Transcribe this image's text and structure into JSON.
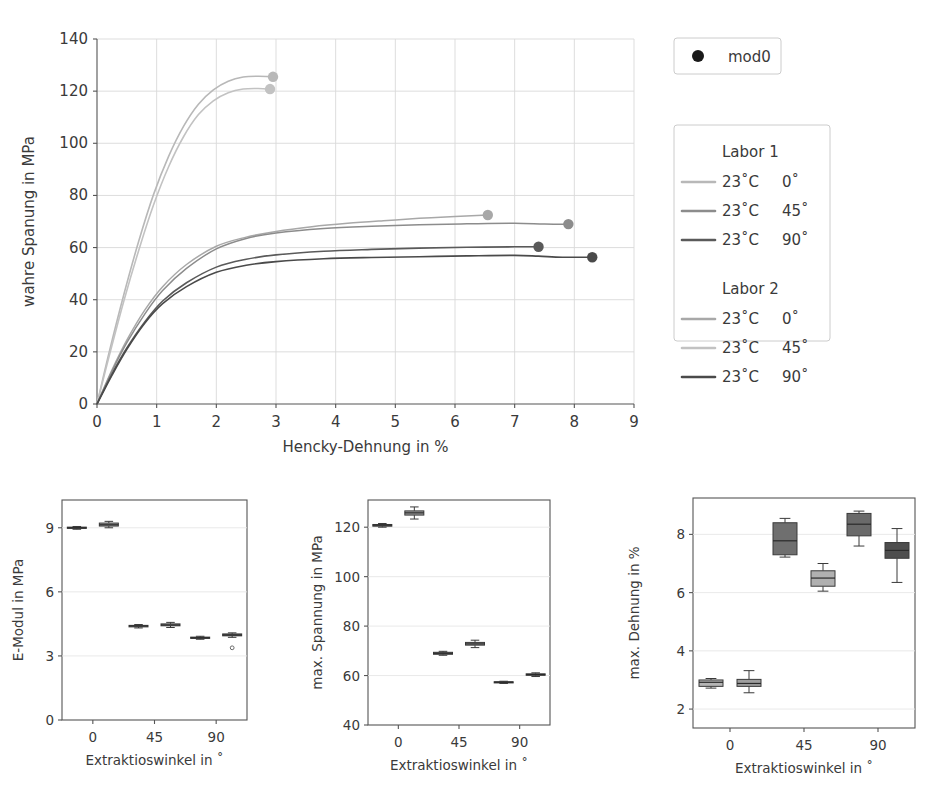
{
  "figure": {
    "title": "",
    "legend_marker": {
      "label": "mod0",
      "marker": "filled-circle",
      "color": "#1a1a1a"
    },
    "series_legend": {
      "groups": [
        {
          "heading": "Labor 1",
          "entries": [
            {
              "temp": "23˚C",
              "angle": "0˚",
              "color": "#b8b8b8"
            },
            {
              "temp": "23˚C",
              "angle": "45˚",
              "color": "#8c8c8c"
            },
            {
              "temp": "23˚C",
              "angle": "90˚",
              "color": "#5a5a5a"
            }
          ]
        },
        {
          "heading": "Labor 2",
          "entries": [
            {
              "temp": "23˚C",
              "angle": "0˚",
              "color": "#a8a8a8"
            },
            {
              "temp": "23˚C",
              "angle": "45˚",
              "color": "#c2c2c2"
            },
            {
              "temp": "23˚C",
              "angle": "90˚",
              "color": "#4a4a4a"
            }
          ]
        }
      ]
    }
  },
  "chart_data": [
    {
      "id": "stress-strain",
      "type": "line",
      "title": "",
      "xlabel": "Hencky-Dehnung in %",
      "ylabel": "wahre Spanung in MPa",
      "xlim": [
        0,
        9
      ],
      "ylim": [
        0,
        140
      ],
      "xticks": [
        0,
        1,
        2,
        3,
        4,
        5,
        6,
        7,
        8,
        9
      ],
      "yticks": [
        0,
        20,
        40,
        60,
        80,
        100,
        120,
        140
      ],
      "grid": true,
      "legend_position": "right-outside",
      "endpoint_marker": "mod0",
      "series": [
        {
          "name": "Labor 1 23˚C 0˚",
          "color": "#b8b8b8",
          "width": 1.6,
          "endpoint": [
            2.95,
            125.5
          ],
          "x": [
            0,
            0.2,
            0.45,
            0.7,
            0.95,
            1.2,
            1.45,
            1.7,
            1.95,
            2.2,
            2.45,
            2.7,
            2.95
          ],
          "y": [
            0,
            19.5,
            42.0,
            62.5,
            80.5,
            95.0,
            106.5,
            115.0,
            120.5,
            123.8,
            125.4,
            125.7,
            125.5
          ]
        },
        {
          "name": "Labor 2 23˚C 0˚",
          "color": "#c2c2c2",
          "width": 1.6,
          "endpoint": [
            2.9,
            120.8
          ],
          "x": [
            0,
            0.2,
            0.45,
            0.7,
            0.95,
            1.2,
            1.45,
            1.7,
            1.95,
            2.2,
            2.45,
            2.7,
            2.9
          ],
          "y": [
            0,
            18.0,
            39.5,
            59.0,
            76.5,
            91.0,
            102.5,
            111.0,
            116.3,
            119.4,
            120.8,
            121.0,
            120.8
          ]
        },
        {
          "name": "Labor 2 23˚C 45˚",
          "color": "#a8a8a8",
          "width": 1.5,
          "endpoint": [
            6.55,
            72.5
          ],
          "x": [
            0,
            0.25,
            0.5,
            0.8,
            1.1,
            1.5,
            2.0,
            2.5,
            3.0,
            3.6,
            4.2,
            4.8,
            5.4,
            6.0,
            6.55
          ],
          "y": [
            0,
            13.0,
            24.5,
            36.0,
            45.0,
            53.5,
            60.5,
            64.0,
            66.2,
            68.0,
            69.3,
            70.3,
            71.2,
            71.9,
            72.5
          ]
        },
        {
          "name": "Labor 1 23˚C 45˚",
          "color": "#8c8c8c",
          "width": 1.5,
          "endpoint": [
            7.9,
            69.0
          ],
          "x": [
            0,
            0.25,
            0.5,
            0.8,
            1.1,
            1.5,
            2.0,
            2.5,
            3.0,
            3.8,
            4.6,
            5.4,
            6.2,
            7.0,
            7.5,
            7.9
          ],
          "y": [
            0,
            12.5,
            23.5,
            34.5,
            43.5,
            52.0,
            59.5,
            63.5,
            65.6,
            67.3,
            68.2,
            68.8,
            69.1,
            69.3,
            69.0,
            69.0
          ]
        },
        {
          "name": "Labor 1 23˚C 90˚",
          "color": "#5a5a5a",
          "width": 1.6,
          "endpoint": [
            7.4,
            60.3
          ],
          "x": [
            0,
            0.25,
            0.5,
            0.8,
            1.1,
            1.5,
            2.0,
            2.5,
            3.0,
            3.8,
            4.6,
            5.4,
            6.2,
            7.0,
            7.4
          ],
          "y": [
            0,
            11.5,
            21.5,
            31.5,
            39.5,
            46.5,
            52.5,
            55.5,
            57.2,
            58.6,
            59.3,
            59.8,
            60.1,
            60.3,
            60.3
          ]
        },
        {
          "name": "Labor 2 23˚C 90˚",
          "color": "#4a4a4a",
          "width": 1.6,
          "endpoint": [
            8.3,
            56.3
          ],
          "x": [
            0,
            0.25,
            0.5,
            0.8,
            1.1,
            1.5,
            2.0,
            2.5,
            3.0,
            3.8,
            4.6,
            5.4,
            6.2,
            7.0,
            7.4,
            7.8,
            8.3
          ],
          "y": [
            0,
            11.0,
            21.0,
            31.0,
            38.5,
            45.0,
            50.5,
            53.2,
            54.6,
            55.7,
            56.2,
            56.5,
            56.8,
            57.0,
            56.7,
            56.3,
            56.3
          ]
        }
      ]
    },
    {
      "id": "e-modul-box",
      "type": "box",
      "title": "",
      "xlabel": "Extraktioswinkel in ˚",
      "ylabel": "E-Modul in MPa",
      "xticklabels": [
        "0",
        "45",
        "90"
      ],
      "ylim": [
        0,
        10.3
      ],
      "yticks": [
        0,
        3,
        6,
        9
      ],
      "grid": true,
      "boxes": [
        {
          "group": "0",
          "lab": "Labor 1",
          "color": "#9a9a9a",
          "q1": 8.97,
          "med": 9.0,
          "q3": 9.03,
          "whislo": 8.93,
          "whishi": 9.06,
          "outliers": []
        },
        {
          "group": "0",
          "lab": "Labor 2",
          "color": "#9a9a9a",
          "q1": 9.08,
          "med": 9.14,
          "q3": 9.22,
          "whislo": 9.0,
          "whishi": 9.3,
          "outliers": []
        },
        {
          "group": "45",
          "lab": "Labor 1",
          "color": "#9a9a9a",
          "q1": 4.36,
          "med": 4.4,
          "q3": 4.43,
          "whislo": 4.31,
          "whishi": 4.47,
          "outliers": []
        },
        {
          "group": "45",
          "lab": "Labor 2",
          "color": "#9a9a9a",
          "q1": 4.41,
          "med": 4.45,
          "q3": 4.5,
          "whislo": 4.33,
          "whishi": 4.57,
          "outliers": []
        },
        {
          "group": "90",
          "lab": "Labor 1",
          "color": "#9a9a9a",
          "q1": 3.82,
          "med": 3.85,
          "q3": 3.88,
          "whislo": 3.78,
          "whishi": 3.92,
          "outliers": []
        },
        {
          "group": "90",
          "lab": "Labor 2",
          "color": "#6e6e6e",
          "q1": 3.94,
          "med": 3.98,
          "q3": 4.03,
          "whislo": 3.87,
          "whishi": 4.08,
          "outliers": [
            3.38
          ]
        }
      ]
    },
    {
      "id": "max-spannung-box",
      "type": "box",
      "title": "",
      "xlabel": "Extraktioswinkel in ˚",
      "ylabel": "max. Spannung in MPa",
      "xticklabels": [
        "0",
        "45",
        "90"
      ],
      "ylim": [
        40,
        131
      ],
      "yticks": [
        40,
        60,
        80,
        100,
        120
      ],
      "grid": true,
      "boxes": [
        {
          "group": "0",
          "lab": "Labor 1",
          "color": "#9a9a9a",
          "q1": 120.4,
          "med": 120.8,
          "q3": 121.1,
          "whislo": 120.0,
          "whishi": 121.5,
          "outliers": []
        },
        {
          "group": "0",
          "lab": "Labor 2",
          "color": "#9a9a9a",
          "q1": 124.9,
          "med": 125.8,
          "q3": 126.6,
          "whislo": 123.3,
          "whishi": 128.2,
          "outliers": []
        },
        {
          "group": "45",
          "lab": "Labor 1",
          "color": "#9a9a9a",
          "q1": 68.6,
          "med": 69.0,
          "q3": 69.4,
          "whislo": 68.2,
          "whishi": 69.8,
          "outliers": []
        },
        {
          "group": "45",
          "lab": "Labor 2",
          "color": "#9a9a9a",
          "q1": 72.3,
          "med": 72.8,
          "q3": 73.4,
          "whislo": 71.3,
          "whishi": 74.3,
          "outliers": []
        },
        {
          "group": "90",
          "lab": "Labor 1",
          "color": "#9a9a9a",
          "q1": 57.1,
          "med": 57.3,
          "q3": 57.5,
          "whislo": 56.8,
          "whishi": 57.7,
          "outliers": []
        },
        {
          "group": "90",
          "lab": "Labor 2",
          "color": "#8a8a8a",
          "q1": 60.1,
          "med": 60.4,
          "q3": 60.7,
          "whislo": 59.6,
          "whishi": 61.1,
          "outliers": []
        }
      ]
    },
    {
      "id": "max-dehnung-box",
      "type": "box",
      "title": "",
      "xlabel": "Extraktioswinkel in ˚",
      "ylabel": "max. Dehnung in %",
      "xticklabels": [
        "0",
        "45",
        "90"
      ],
      "ylim": [
        1.35,
        9.25
      ],
      "yticks": [
        2,
        4,
        6,
        8
      ],
      "grid": true,
      "boxes": [
        {
          "group": "0",
          "lab": "Labor 1",
          "color": "#b5b5b5",
          "q1": 2.78,
          "med": 2.92,
          "q3": 3.0,
          "whislo": 2.72,
          "whishi": 3.05,
          "outliers": []
        },
        {
          "group": "0",
          "lab": "Labor 2",
          "color": "#9e9e9e",
          "q1": 2.78,
          "med": 2.88,
          "q3": 3.02,
          "whislo": 2.56,
          "whishi": 3.32,
          "outliers": []
        },
        {
          "group": "45",
          "lab": "Labor 1",
          "color": "#6f6f6f",
          "q1": 7.3,
          "med": 7.78,
          "q3": 8.4,
          "whislo": 7.22,
          "whishi": 8.55,
          "outliers": []
        },
        {
          "group": "45",
          "lab": "Labor 2",
          "color": "#b0b0b0",
          "q1": 6.22,
          "med": 6.5,
          "q3": 6.75,
          "whislo": 6.05,
          "whishi": 7.0,
          "outliers": []
        },
        {
          "group": "90",
          "lab": "Labor 1",
          "color": "#6a6a6a",
          "q1": 7.95,
          "med": 8.35,
          "q3": 8.72,
          "whislo": 7.6,
          "whishi": 8.8,
          "outliers": []
        },
        {
          "group": "90",
          "lab": "Labor 2",
          "color": "#4e4e4e",
          "q1": 7.18,
          "med": 7.45,
          "q3": 7.72,
          "whislo": 6.35,
          "whishi": 8.2,
          "outliers": []
        }
      ]
    }
  ]
}
